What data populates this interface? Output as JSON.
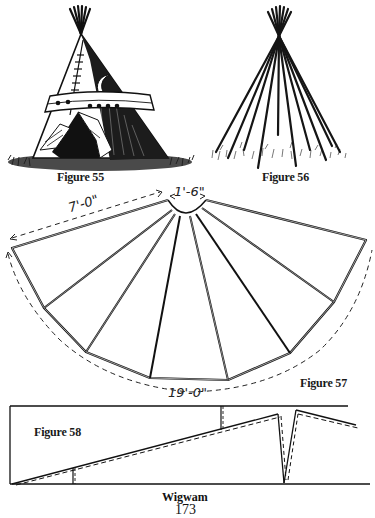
{
  "figures": {
    "fig55": {
      "caption": "Figure 55",
      "subject": "painted tipi with smoke flaps and door"
    },
    "fig56": {
      "caption": "Figure 56",
      "subject": "tipi pole framework"
    },
    "fig57": {
      "caption": "Figure 57",
      "subject": "tipi cover layout pattern",
      "dimensions": {
        "radius": "7'-0\"",
        "top_opening": "1'-6\"",
        "outer_arc": "19'-0\""
      }
    },
    "fig58": {
      "caption": "Figure 58",
      "subject": "cover section diagram"
    }
  },
  "footer": {
    "section_title": "Wigwam",
    "page_number": "173"
  },
  "colors": {
    "ink": "#111111",
    "paper": "#ffffff"
  }
}
